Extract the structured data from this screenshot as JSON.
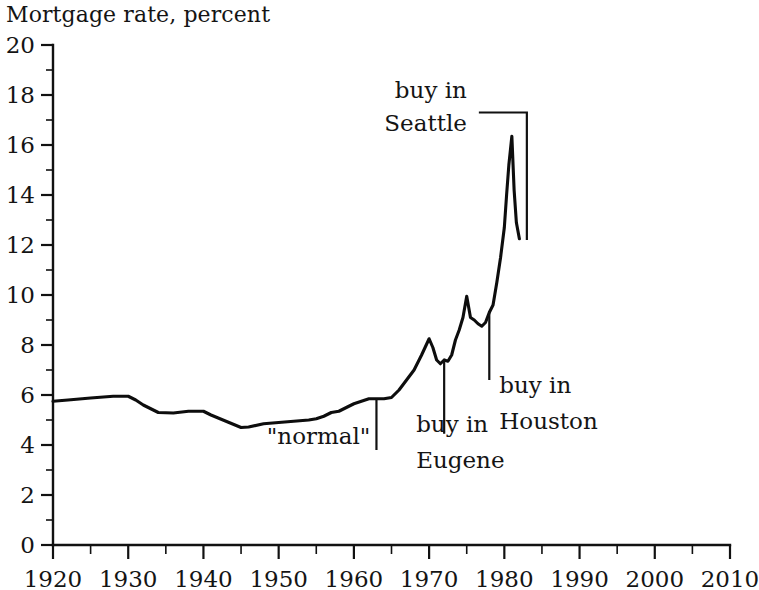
{
  "chart_data": {
    "type": "line",
    "title": "Mortgage rate, percent",
    "xlabel": "",
    "ylabel": "Mortgage rate, percent",
    "xlim": [
      1920,
      2010
    ],
    "ylim": [
      0,
      20
    ],
    "grid": false,
    "legend": "none",
    "x_ticks": [
      "1920",
      "1930",
      "1940",
      "1950",
      "1960",
      "1970",
      "1980",
      "1990",
      "2000",
      "2010"
    ],
    "x_tick_values": [
      1920,
      1930,
      1940,
      1950,
      1960,
      1970,
      1980,
      1990,
      2000,
      2010
    ],
    "x_minor_step": 5,
    "y_ticks": [
      "0",
      "2",
      "4",
      "6",
      "8",
      "10",
      "12",
      "14",
      "16",
      "18",
      "20"
    ],
    "y_tick_values": [
      0,
      2,
      4,
      6,
      8,
      10,
      12,
      14,
      16,
      18,
      20
    ],
    "y_minor_step": 1,
    "series": [
      {
        "name": "Mortgage rate",
        "color": "#0d0d0d",
        "x": [
          1920,
          1922,
          1925,
          1928,
          1930,
          1931,
          1932,
          1934,
          1936,
          1938,
          1940,
          1941,
          1943,
          1945,
          1946,
          1948,
          1950,
          1952,
          1954,
          1955,
          1956,
          1957,
          1958,
          1959,
          1960,
          1961,
          1962,
          1963,
          1964,
          1965,
          1966,
          1967,
          1968,
          1969,
          1970,
          1970.5,
          1971,
          1971.5,
          1972,
          1972.5,
          1973,
          1973.5,
          1974,
          1974.5,
          1975,
          1975.5,
          1976,
          1976.5,
          1977,
          1977.5,
          1978,
          1978.5,
          1979,
          1979.5,
          1980,
          1980.3,
          1980.6,
          1981,
          1981.3,
          1981.6,
          1982
        ],
        "y": [
          5.75,
          5.8,
          5.88,
          5.95,
          5.95,
          5.8,
          5.6,
          5.3,
          5.28,
          5.35,
          5.35,
          5.2,
          4.95,
          4.7,
          4.72,
          4.85,
          4.9,
          4.95,
          5.0,
          5.05,
          5.15,
          5.3,
          5.35,
          5.5,
          5.65,
          5.75,
          5.85,
          5.85,
          5.85,
          5.9,
          6.2,
          6.6,
          7.0,
          7.6,
          8.25,
          7.9,
          7.4,
          7.25,
          7.4,
          7.35,
          7.6,
          8.2,
          8.6,
          9.1,
          9.95,
          9.1,
          9.0,
          8.85,
          8.75,
          8.9,
          9.3,
          9.6,
          10.5,
          11.5,
          12.7,
          14.0,
          15.2,
          16.35,
          14.2,
          12.9,
          12.25
        ]
      }
    ],
    "annotations": [
      {
        "id": "normal",
        "text": "\"normal\"",
        "pointer_year": 1963,
        "pointer_value": 5.85,
        "label_value": 3.8
      },
      {
        "id": "eugene",
        "line1": "buy in",
        "line2": "Eugene",
        "pointer_year": 1972,
        "pointer_value": 7.45,
        "label_value": 4.45
      },
      {
        "id": "houston",
        "line1": "buy in",
        "line2": "Houston",
        "pointer_year": 1978,
        "pointer_value": 9.35,
        "label_value": 6.6
      },
      {
        "id": "seattle",
        "line1": "buy in",
        "line2": "Seattle",
        "pointer_year": 1981.4,
        "pointer_value": 17.3,
        "label_value": 17.8
      }
    ]
  }
}
